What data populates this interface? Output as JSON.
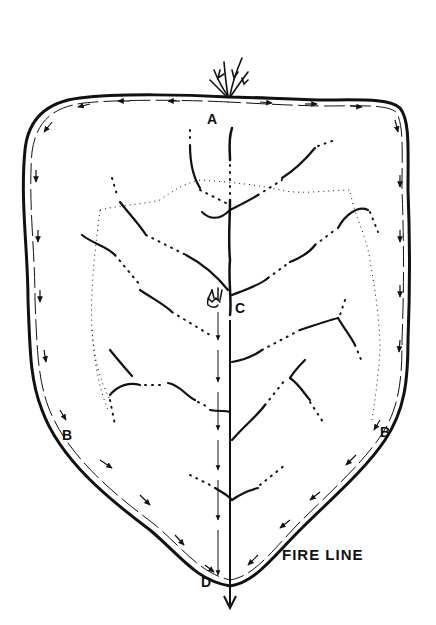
{
  "diagram": {
    "type": "fire-suppression-diagram",
    "labels": {
      "A": "A",
      "B_left": "B",
      "B_right": "B",
      "C": "C",
      "D": "D",
      "fire_line": "FIRE LINE"
    },
    "colors": {
      "ink": "#111111",
      "background": "#ffffff"
    },
    "icons": [
      "fire-flame-icon-top",
      "fire-flame-icon-center"
    ]
  }
}
